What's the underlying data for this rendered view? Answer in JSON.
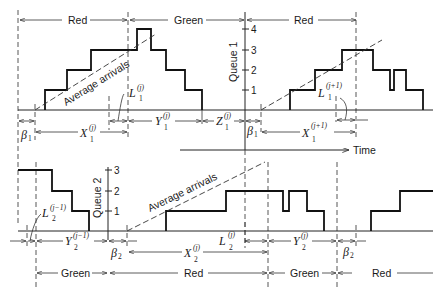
{
  "queue1": {
    "axis_label": "Queue 1",
    "ticks": [
      "1",
      "2",
      "3",
      "4"
    ],
    "phases": [
      {
        "label": "Red"
      },
      {
        "label": "Green"
      },
      {
        "label": "Red"
      }
    ],
    "arrivals_label": "Average arrivals",
    "intervals": {
      "beta_left": {
        "sym": "β",
        "sub": "1"
      },
      "x_j": {
        "sym": "X",
        "sub": "1",
        "sup": "(j)"
      },
      "l_j": {
        "sym": "L",
        "sub": "1",
        "sup": "(j)"
      },
      "y_j": {
        "sym": "Y",
        "sub": "1",
        "sup": "(j)"
      },
      "z_j": {
        "sym": "Z",
        "sub": "1",
        "sup": "(j)"
      },
      "beta_right": {
        "sym": "β",
        "sub": "1"
      },
      "x_j1": {
        "sym": "X",
        "sub": "1",
        "sup": "(j+1)"
      },
      "l_j1": {
        "sym": "L",
        "sub": "1",
        "sup": "(j+1)"
      }
    }
  },
  "time_axis": {
    "label": "Time"
  },
  "queue2": {
    "axis_label": "Queue 2",
    "ticks": [
      "1",
      "2",
      "3"
    ],
    "phases": [
      {
        "label": "Green"
      },
      {
        "label": "Red"
      },
      {
        "label": "Green"
      },
      {
        "label": "Red"
      }
    ],
    "arrivals_label": "Average arrivals",
    "intervals": {
      "l_jm1": {
        "sym": "L",
        "sub": "2",
        "sup": "(j−1)"
      },
      "y_jm1": {
        "sym": "Y",
        "sub": "2",
        "sup": "(j−1)"
      },
      "beta_left": {
        "sym": "β",
        "sub": "2"
      },
      "x_j": {
        "sym": "X",
        "sub": "2",
        "sup": "(j)"
      },
      "l_j": {
        "sym": "L",
        "sub": "2",
        "sup": "(j)"
      },
      "y_j": {
        "sym": "Y",
        "sub": "2",
        "sup": "(j)"
      },
      "beta_right": {
        "sym": "β",
        "sub": "2"
      }
    }
  }
}
